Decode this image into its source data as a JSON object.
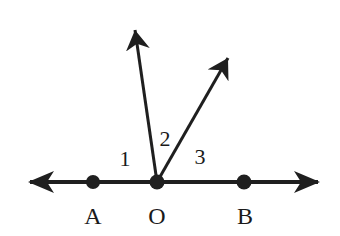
{
  "diagram": {
    "type": "geometry-angles",
    "colors": {
      "stroke": "#1f1f1f",
      "background": "#ffffff"
    },
    "line": {
      "name": "line AB",
      "from": [
        30,
        182
      ],
      "to": [
        318,
        182
      ],
      "arrows": "both"
    },
    "points": [
      {
        "label": "A",
        "x": 93,
        "y": 182,
        "label_x": 93,
        "label_y": 224
      },
      {
        "label": "O",
        "x": 157,
        "y": 182,
        "label_x": 157,
        "label_y": 224
      },
      {
        "label": "B",
        "x": 244,
        "y": 182,
        "label_x": 244,
        "label_y": 224
      }
    ],
    "rays": [
      {
        "name": "ray-left",
        "from": [
          157,
          182
        ],
        "to": [
          135,
          30
        ]
      },
      {
        "name": "ray-right",
        "from": [
          157,
          182
        ],
        "to": [
          228,
          58
        ]
      }
    ],
    "angle_labels": [
      {
        "label": "1",
        "x": 125,
        "y": 166
      },
      {
        "label": "2",
        "x": 163,
        "y": 145
      },
      {
        "label": "3",
        "x": 200,
        "y": 163
      }
    ]
  }
}
